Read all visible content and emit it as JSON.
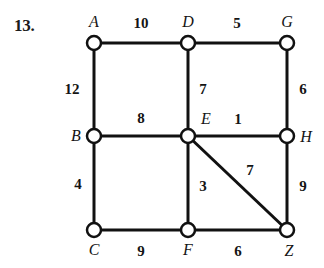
{
  "problem": {
    "number": "13."
  },
  "graph": {
    "type": "weighted-undirected-graph",
    "node_radius": 7,
    "edge_color": "#111111",
    "node_fill": "#ffffff",
    "node_stroke": "#111111",
    "nodes": [
      {
        "id": "A",
        "label": "A",
        "x": 94,
        "y": 43,
        "label_x": 94,
        "label_y": 22,
        "label_pos": "above"
      },
      {
        "id": "D",
        "label": "D",
        "x": 188,
        "y": 43,
        "label_x": 188,
        "label_y": 22,
        "label_pos": "above"
      },
      {
        "id": "G",
        "label": "G",
        "x": 287,
        "y": 43,
        "label_x": 287,
        "label_y": 22,
        "label_pos": "above"
      },
      {
        "id": "B",
        "label": "B",
        "x": 94,
        "y": 136,
        "label_x": 76,
        "label_y": 136,
        "label_pos": "left"
      },
      {
        "id": "E",
        "label": "E",
        "x": 188,
        "y": 136,
        "label_x": 206,
        "label_y": 119,
        "label_pos": "above-right"
      },
      {
        "id": "H",
        "label": "H",
        "x": 287,
        "y": 136,
        "label_x": 306,
        "label_y": 137,
        "label_pos": "right"
      },
      {
        "id": "C",
        "label": "C",
        "x": 94,
        "y": 230,
        "label_x": 94,
        "label_y": 250,
        "label_pos": "below"
      },
      {
        "id": "F",
        "label": "F",
        "x": 188,
        "y": 230,
        "label_x": 188,
        "label_y": 250,
        "label_pos": "below"
      },
      {
        "id": "Z",
        "label": "Z",
        "x": 287,
        "y": 230,
        "label_x": 289,
        "label_y": 251,
        "label_pos": "below"
      }
    ],
    "edges": [
      {
        "from": "A",
        "to": "D",
        "weight": "10",
        "label_x": 141,
        "label_y": 23
      },
      {
        "from": "D",
        "to": "G",
        "weight": "5",
        "label_x": 237,
        "label_y": 23
      },
      {
        "from": "A",
        "to": "B",
        "weight": "12",
        "label_x": 72,
        "label_y": 89
      },
      {
        "from": "D",
        "to": "E",
        "weight": "7",
        "label_x": 203,
        "label_y": 89
      },
      {
        "from": "G",
        "to": "H",
        "weight": "6",
        "label_x": 303,
        "label_y": 89
      },
      {
        "from": "B",
        "to": "E",
        "weight": "8",
        "label_x": 141,
        "label_y": 118
      },
      {
        "from": "E",
        "to": "H",
        "weight": "1",
        "label_x": 238,
        "label_y": 119
      },
      {
        "from": "B",
        "to": "C",
        "weight": "4",
        "label_x": 78,
        "label_y": 184
      },
      {
        "from": "E",
        "to": "F",
        "weight": "3",
        "label_x": 203,
        "label_y": 186
      },
      {
        "from": "E",
        "to": "Z",
        "weight": "7",
        "label_x": 250,
        "label_y": 170
      },
      {
        "from": "H",
        "to": "Z",
        "weight": "9",
        "label_x": 303,
        "label_y": 186
      },
      {
        "from": "C",
        "to": "F",
        "weight": "9",
        "label_x": 141,
        "label_y": 251
      },
      {
        "from": "F",
        "to": "Z",
        "weight": "6",
        "label_x": 238,
        "label_y": 251
      }
    ]
  }
}
